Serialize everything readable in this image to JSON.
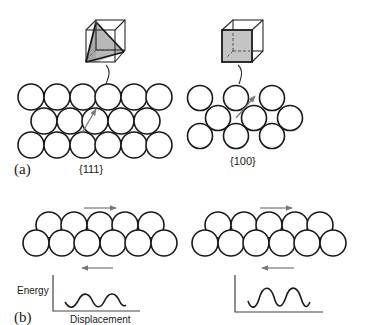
{
  "figure": {
    "panel_a": {
      "label": "(a)",
      "left": {
        "plane_label": "{111}",
        "unit_cell": "cube-with-tetrahedron-shaded",
        "shade_color": "#b8b8b8",
        "rows": [
          6,
          5,
          6
        ],
        "packing": "close-packed hexagonal",
        "arrow": "diagonal slip direction"
      },
      "right": {
        "plane_label": "{100}",
        "unit_cell": "cube-with-front-face-shaded",
        "shade_color": "#c4c4c4",
        "rows": [
          3,
          3,
          3
        ],
        "packing": "square",
        "arrow": "diagonal slip direction"
      }
    },
    "panel_b": {
      "label": "(b)",
      "left": {
        "top_row_atoms": 5,
        "bottom_row_atoms": 6,
        "top_arrow": "right",
        "bottom_arrow": "left",
        "plot": {
          "ylabel": "Energy",
          "xlabel": "Displacement",
          "amplitude": "small",
          "periods": 2
        }
      },
      "right": {
        "top_row_atoms": 5,
        "bottom_row_atoms": 6,
        "top_arrow": "right",
        "bottom_arrow": "left",
        "plot": {
          "ylabel": "",
          "xlabel": "",
          "amplitude": "large",
          "periods": 2
        }
      }
    },
    "colors": {
      "line": "#1a1a1a",
      "arrow": "#777777",
      "background": "#ffffff"
    }
  }
}
